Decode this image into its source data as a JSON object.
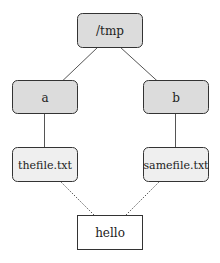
{
  "diagram": {
    "colors": {
      "dir_fill": "#dcdcdc",
      "file_fill": "#efefef",
      "inode_fill": "#ffffff",
      "stroke": "#333333",
      "edge": "#555555"
    },
    "nodes": {
      "tmp": {
        "label": "/tmp",
        "kind": "directory"
      },
      "a": {
        "label": "a",
        "kind": "directory"
      },
      "b": {
        "label": "b",
        "kind": "directory"
      },
      "thefile": {
        "label": "thefile.txt",
        "kind": "file-entry"
      },
      "samefile": {
        "label": "samefile.txt",
        "kind": "file-entry"
      },
      "hello": {
        "label": "hello",
        "kind": "file-content"
      }
    },
    "edges": [
      {
        "from": "tmp",
        "to": "a",
        "style": "solid"
      },
      {
        "from": "tmp",
        "to": "b",
        "style": "solid"
      },
      {
        "from": "a",
        "to": "thefile",
        "style": "solid"
      },
      {
        "from": "b",
        "to": "samefile",
        "style": "solid"
      },
      {
        "from": "thefile",
        "to": "hello",
        "style": "dotted"
      },
      {
        "from": "samefile",
        "to": "hello",
        "style": "dotted"
      }
    ]
  }
}
